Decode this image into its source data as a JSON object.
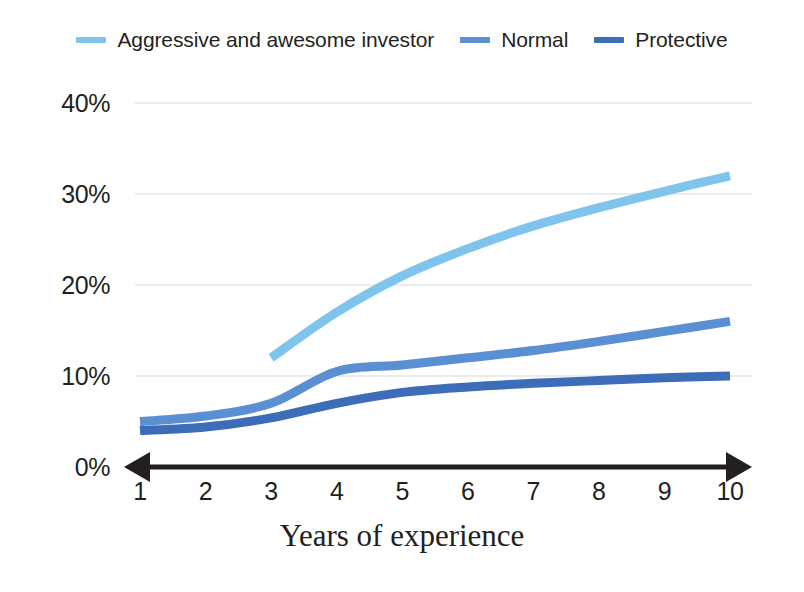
{
  "chart_data": {
    "type": "line",
    "title": "",
    "xlabel": "Years of experience",
    "ylabel": "",
    "x": [
      1,
      2,
      3,
      4,
      5,
      6,
      7,
      8,
      9,
      10
    ],
    "categories": [
      "1",
      "2",
      "3",
      "4",
      "5",
      "6",
      "7",
      "8",
      "9",
      "10"
    ],
    "xlim": [
      1,
      10
    ],
    "ylim": [
      0,
      40
    ],
    "y_ticks": [
      0,
      10,
      20,
      30,
      40
    ],
    "y_tick_labels": [
      "0%",
      "10%",
      "20%",
      "30%",
      "40%"
    ],
    "x_tick_labels": [
      "1",
      "2",
      "3",
      "4",
      "5",
      "6",
      "7",
      "8",
      "9",
      "10"
    ],
    "grid": true,
    "grid_axis": "y",
    "legend_position": "top",
    "x_axis_style": "double-headed-arrow",
    "series": [
      {
        "name": "Aggressive and awesome investor",
        "color": "#7FC4EC",
        "x": [
          3,
          4,
          5,
          6,
          7,
          8,
          9,
          10
        ],
        "values": [
          12.0,
          17.0,
          21.0,
          24.0,
          26.5,
          28.5,
          30.3,
          32.0
        ]
      },
      {
        "name": "Normal",
        "color": "#5B8FD4",
        "x": [
          1,
          2,
          3,
          4,
          5,
          6,
          7,
          8,
          9,
          10
        ],
        "values": [
          5.0,
          5.6,
          7.0,
          10.5,
          11.2,
          12.0,
          12.8,
          13.8,
          14.9,
          16.0
        ]
      },
      {
        "name": "Protective",
        "color": "#3D6CB8",
        "x": [
          1,
          2,
          3,
          4,
          5,
          6,
          7,
          8,
          9,
          10
        ],
        "values": [
          4.0,
          4.4,
          5.4,
          7.0,
          8.2,
          8.8,
          9.2,
          9.5,
          9.8,
          10.0
        ]
      }
    ]
  },
  "legend": {
    "items": [
      {
        "label": "Aggressive and awesome investor",
        "color": "#7FC4EC"
      },
      {
        "label": "Normal",
        "color": "#5B8FD4"
      },
      {
        "label": "Protective",
        "color": "#3D6CB8"
      }
    ]
  },
  "axes": {
    "x_title": "Years of experience",
    "grid_color": "#d9d9d9",
    "axis_color": "#231f20"
  }
}
